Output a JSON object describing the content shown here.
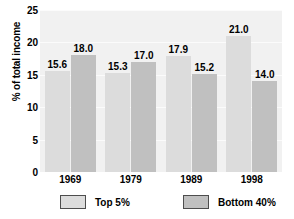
{
  "chart_data": {
    "type": "bar",
    "title": "",
    "xlabel": "",
    "ylabel": "% of total income",
    "categories": [
      "1969",
      "1979",
      "1989",
      "1998"
    ],
    "series": [
      {
        "name": "Top 5%",
        "values": [
          15.6,
          15.3,
          17.9,
          21.0
        ],
        "color": "#dcdcdc"
      },
      {
        "name": "Bottom 40%",
        "values": [
          18.0,
          17.0,
          15.2,
          14.0
        ],
        "color": "#c0c0c0"
      }
    ],
    "ylim": [
      0,
      25
    ],
    "yticks": [
      0,
      5,
      10,
      15,
      20,
      25
    ],
    "ytick_labels": [
      "0",
      "5",
      "10",
      "15",
      "20",
      "25"
    ],
    "value_labels": [
      [
        "15.6",
        "15.3",
        "17.9",
        "21.0"
      ],
      [
        "18.0",
        "17.0",
        "15.2",
        "14.0"
      ]
    ],
    "grid": true,
    "legend_position": "bottom",
    "plot_background": "#f1f1f1",
    "figure_background": "#ffffff"
  },
  "axes": {
    "y_title": "% of total income"
  },
  "legend": {
    "entries": [
      {
        "label": "Top 5%"
      },
      {
        "label": "Bottom 40%"
      }
    ]
  }
}
